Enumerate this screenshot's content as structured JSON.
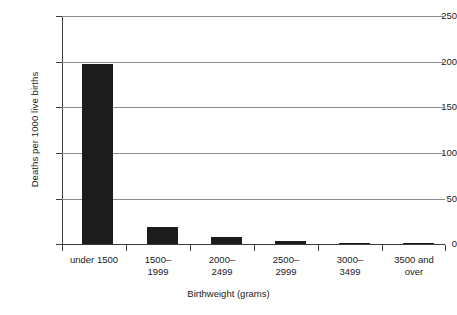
{
  "chart_data": {
    "type": "bar",
    "title": "",
    "xlabel": "Birthweight (grams)",
    "ylabel": "Deaths per 1000 live births",
    "categories": [
      "under 1500",
      "1500–1999",
      "2000–2499",
      "2500–2999",
      "3000–3499",
      "3500 and over"
    ],
    "values": [
      197,
      19,
      8,
      3.5,
      1,
      0.4
    ],
    "ylim": [
      0,
      250
    ],
    "yticks": [
      0,
      50,
      100,
      150,
      200,
      250
    ],
    "ytick_labels": [
      "0",
      "50",
      "100",
      "150",
      "200",
      "250"
    ],
    "grid": true,
    "legend": false,
    "bar_color": "#1c1c1c",
    "grid_color": "#8c8c8c",
    "axis_color": "#3b3b3b",
    "background": "#ffffff"
  },
  "axes": {
    "y_title": "Deaths per 1000 live births",
    "x_title": "Birthweight (grams)"
  },
  "ticks": {
    "y": [
      {
        "label": "250",
        "value": 250
      },
      {
        "label": "200",
        "value": 200
      },
      {
        "label": "150",
        "value": 150
      },
      {
        "label": "100",
        "value": 100
      },
      {
        "label": "50",
        "value": 50
      },
      {
        "label": "0",
        "value": 0
      }
    ]
  },
  "bars": [
    {
      "label": "under 1500",
      "value": 197
    },
    {
      "label": "1500–1999",
      "value": 19
    },
    {
      "label": "2000–2499",
      "value": 8
    },
    {
      "label": "2500–2999",
      "value": 3.5
    },
    {
      "label": "3000–3499",
      "value": 1
    },
    {
      "label": "3500 and over",
      "value": 0.4
    }
  ],
  "x_labels": [
    "under 1500",
    "1500–\n1999",
    "2000–\n2499",
    "2500–\n2999",
    "3000–\n3499",
    "3500 and\nover"
  ]
}
